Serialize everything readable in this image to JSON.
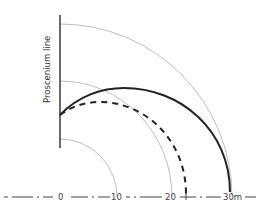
{
  "diagram": {
    "vertical_label": "Proscenium line",
    "axis_labels": [
      "0",
      "10",
      "20",
      "30m"
    ],
    "colors": {
      "thin_arc": "#9a9a9a",
      "thick_arc": "#222222",
      "dashed_arc": "#222222",
      "axis": "#444444",
      "proscenium": "#444444"
    }
  }
}
